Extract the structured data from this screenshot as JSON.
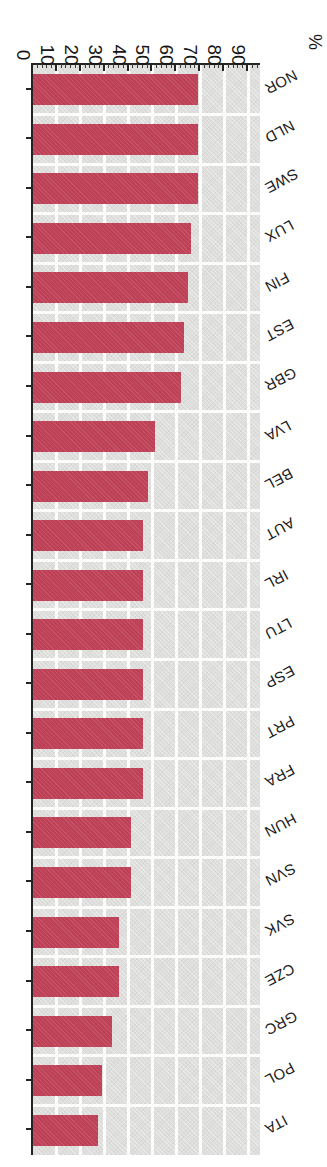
{
  "chart_data": {
    "type": "bar",
    "orientation": "horizontal",
    "title": "",
    "subtitle": "",
    "xlabel": "%",
    "ylabel": "",
    "xlim": [
      0,
      95
    ],
    "grid": true,
    "legend": null,
    "tick_labels": [
      "0",
      "10",
      "20",
      "30",
      "40",
      "50",
      "60",
      "70",
      "80",
      "90"
    ],
    "tick_values": [
      0,
      10,
      20,
      30,
      40,
      50,
      60,
      70,
      80,
      90
    ],
    "minor_tick_step": 2,
    "bar_color": "#bd4056",
    "plot_background": "#dededc",
    "gridline_color": "#ffffff",
    "axis_color": "#242424",
    "categories": [
      "NOR",
      "NLD",
      "SWE",
      "LUX",
      "FIN",
      "EST",
      "GBR",
      "LVA",
      "BEL",
      "AUT",
      "IRL",
      "LTU",
      "ESP",
      "PRT",
      "FRA",
      "HUN",
      "SVN",
      "SVK",
      "CZE",
      "GRC",
      "POL",
      "ITA"
    ],
    "values": [
      69,
      69,
      69,
      66,
      65,
      63,
      62,
      51,
      48,
      46,
      46,
      46,
      46,
      46,
      46,
      41,
      41,
      36,
      36,
      33,
      29,
      27
    ],
    "bars": [
      {
        "category": "NOR",
        "value": 69
      },
      {
        "category": "NLD",
        "value": 69
      },
      {
        "category": "SWE",
        "value": 69
      },
      {
        "category": "LUX",
        "value": 66
      },
      {
        "category": "FIN",
        "value": 65
      },
      {
        "category": "EST",
        "value": 63
      },
      {
        "category": "GBR",
        "value": 62
      },
      {
        "category": "LVA",
        "value": 51
      },
      {
        "category": "BEL",
        "value": 48
      },
      {
        "category": "AUT",
        "value": 46
      },
      {
        "category": "IRL",
        "value": 46
      },
      {
        "category": "LTU",
        "value": 46
      },
      {
        "category": "ESP",
        "value": 46
      },
      {
        "category": "PRT",
        "value": 46
      },
      {
        "category": "FRA",
        "value": 46
      },
      {
        "category": "HUN",
        "value": 41
      },
      {
        "category": "SVN",
        "value": 41
      },
      {
        "category": "SVK",
        "value": 36
      },
      {
        "category": "CZE",
        "value": 36
      },
      {
        "category": "GRC",
        "value": 33
      },
      {
        "category": "POL",
        "value": 29
      },
      {
        "category": "ITA",
        "value": 27
      }
    ]
  }
}
